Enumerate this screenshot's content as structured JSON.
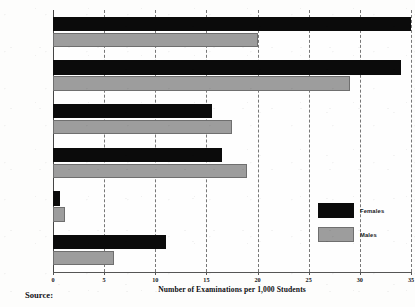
{
  "chart_data": {
    "type": "bar",
    "orientation": "horizontal",
    "title": "",
    "xlabel": "Number of Examinations per 1,000 Students",
    "ylabel": "",
    "xlim": [
      0,
      35
    ],
    "xticks": [
      0,
      5,
      10,
      15,
      20,
      25,
      30,
      35
    ],
    "xticklabels": [
      "0",
      "5",
      "10",
      "15",
      "20",
      "25",
      "30",
      "35"
    ],
    "grid": true,
    "grid_style": "dashed-vertical",
    "legend_position": "inside-right",
    "categories": [
      "English",
      "Social Studies",
      "Calculus",
      "Science",
      "Computer Science",
      "Foreign Language"
    ],
    "series": [
      {
        "name": "Females",
        "color": "#0b0b0b",
        "values": [
          35,
          34,
          15.5,
          16.5,
          0.7,
          11
        ]
      },
      {
        "name": "Males",
        "color": "#9d9d9d",
        "values": [
          20,
          29,
          17.5,
          19,
          1.2,
          6
        ]
      }
    ]
  },
  "legend": {
    "items": [
      {
        "label": "Females",
        "swatch": "female"
      },
      {
        "label": "Males",
        "swatch": "male"
      }
    ]
  },
  "footer": {
    "source_label": "Source:"
  }
}
